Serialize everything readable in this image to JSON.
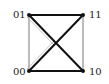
{
  "diagram": {
    "type": "graph",
    "nodes": [
      {
        "id": "01",
        "label": "01",
        "x": 29,
        "y": 15
      },
      {
        "id": "11",
        "label": "11",
        "x": 83,
        "y": 15
      },
      {
        "id": "00",
        "label": "00",
        "x": 29,
        "y": 71
      },
      {
        "id": "10",
        "label": "10",
        "x": 83,
        "y": 71
      }
    ],
    "edges": [
      {
        "from": "01",
        "to": "11",
        "weight": "thick"
      },
      {
        "from": "00",
        "to": "10",
        "weight": "thick"
      },
      {
        "from": "01",
        "to": "10",
        "weight": "thick"
      },
      {
        "from": "00",
        "to": "11",
        "weight": "thick"
      },
      {
        "from": "01",
        "to": "00",
        "weight": "thin"
      },
      {
        "from": "11",
        "to": "10",
        "weight": "thin"
      }
    ],
    "colors": {
      "edge": "#111111",
      "thin_edge": "#555555",
      "faint_edge": "#aaaaaa",
      "label": "#222222"
    }
  }
}
